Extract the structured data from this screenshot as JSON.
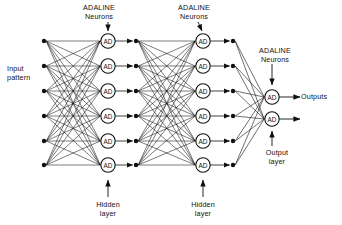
{
  "diagram": {
    "type": "neural-network-diagram",
    "colors": {
      "ink": "#111111",
      "background": "#ffffff",
      "node_fill": "#ffffff"
    },
    "node_text": "AD",
    "labels": {
      "adaline_neurons_1": "ADALINE\nNeurons",
      "adaline_neurons_2": "ADALINE\nNeurons",
      "adaline_neurons_3": "ADALINE\nNeurons",
      "input_pattern": "Input\npattern",
      "outputs": "Outputs",
      "hidden_layer_1": "Hidden\nlayer",
      "hidden_layer_2": "Hidden\nlayer",
      "output_layer": "Output\nlayer"
    },
    "layers": [
      {
        "name": "input-layer",
        "kind": "input-dots",
        "count": 6,
        "x": 44,
        "label": "Input pattern"
      },
      {
        "name": "hidden-layer-1",
        "kind": "adaline-neurons",
        "count": 6,
        "x": 108,
        "label": "Hidden layer"
      },
      {
        "name": "relay-column-1",
        "kind": "relay-dots",
        "count": 6,
        "x": 136,
        "label": ""
      },
      {
        "name": "hidden-layer-2",
        "kind": "adaline-neurons",
        "count": 6,
        "x": 203,
        "label": "Hidden layer"
      },
      {
        "name": "relay-column-2",
        "kind": "relay-dots",
        "count": 6,
        "x": 233,
        "label": ""
      },
      {
        "name": "output-layer",
        "kind": "adaline-neurons",
        "count": 2,
        "x": 272,
        "label": "Output layer"
      }
    ],
    "node_rows_y": [
      41,
      66,
      91,
      116,
      141,
      165
    ],
    "output_rows_y": [
      97,
      119
    ],
    "connections": [
      {
        "from": "input-layer",
        "to": "hidden-layer-1",
        "pattern": "fully-connected"
      },
      {
        "from": "hidden-layer-1",
        "to": "relay-column-1",
        "pattern": "one-to-one"
      },
      {
        "from": "relay-column-1",
        "to": "hidden-layer-2",
        "pattern": "fully-connected"
      },
      {
        "from": "hidden-layer-2",
        "to": "relay-column-2",
        "pattern": "one-to-one"
      },
      {
        "from": "relay-column-2",
        "to": "output-layer",
        "pattern": "fully-connected"
      }
    ]
  }
}
